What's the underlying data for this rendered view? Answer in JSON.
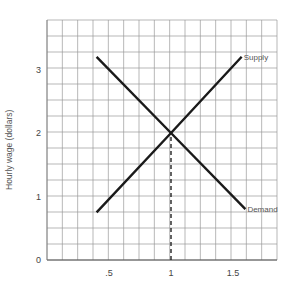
{
  "chart_data": {
    "type": "line",
    "title": "",
    "xlabel": "",
    "ylabel": "Hourly wage (dollars)",
    "xlim": [
      0,
      1.85
    ],
    "ylim": [
      0,
      3.75
    ],
    "grid": true,
    "x_ticks": [
      ".5",
      "1",
      "1.5"
    ],
    "x_tick_values": [
      0.5,
      1,
      1.5
    ],
    "y_ticks": [
      "0",
      "1",
      "2",
      "3"
    ],
    "y_tick_values": [
      0,
      1,
      2,
      3
    ],
    "series": [
      {
        "name": "Supply",
        "x": [
          0.4,
          1.0,
          1.57
        ],
        "y": [
          0.75,
          2.0,
          3.2
        ]
      },
      {
        "name": "Demand",
        "x": [
          0.4,
          1.0,
          1.6
        ],
        "y": [
          3.2,
          2.0,
          0.8
        ]
      }
    ],
    "annotations": [
      {
        "type": "dashed-vertical-line",
        "x": 1,
        "from_y": 0,
        "to_y": 2,
        "label": "equilibrium"
      }
    ],
    "legend": "inline labels at line ends"
  }
}
